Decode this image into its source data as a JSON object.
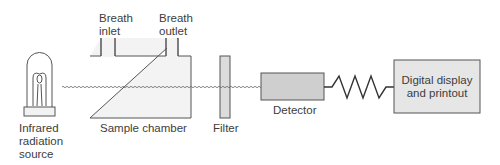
{
  "diagram": {
    "components": {
      "source": {
        "label_lines": [
          "Infrared",
          "radiation",
          "source"
        ]
      },
      "inlet": {
        "label_lines": [
          "Breath",
          "inlet"
        ]
      },
      "outlet": {
        "label_lines": [
          "Breath",
          "outlet"
        ]
      },
      "chamber": {
        "label": "Sample chamber"
      },
      "filter": {
        "label": "Filter"
      },
      "detector": {
        "label": "Detector"
      },
      "display": {
        "label_lines": [
          "Digital display",
          "and printout"
        ]
      }
    },
    "colors": {
      "line": "#555555",
      "chamber_fill": "#f3f3f3",
      "filter_fill": "#dcdcdc",
      "detector_fill": "#cfcfcf",
      "display_fill": "#e6e6e6"
    }
  }
}
